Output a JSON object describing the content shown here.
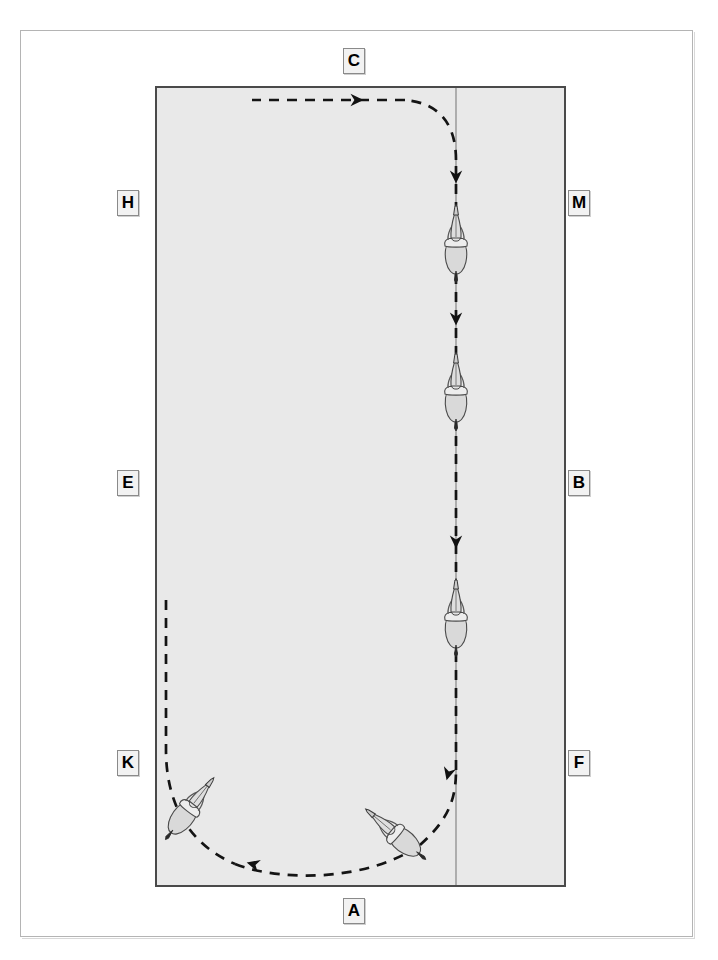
{
  "diagram": {
    "arena": {
      "fill_color": "#e9e9e9",
      "border_color": "#4a4a4a",
      "centerline_color": "#8e8e8e"
    },
    "path": {
      "style": "dashed",
      "color": "#1a1a1a",
      "dash_pattern": "10 8",
      "width": 2.6
    }
  },
  "markers": {
    "top": {
      "label": "C",
      "name": "marker-c"
    },
    "bottom": {
      "label": "A",
      "name": "marker-a"
    },
    "left_top": {
      "label": "H",
      "name": "marker-h"
    },
    "left_mid": {
      "label": "E",
      "name": "marker-e"
    },
    "left_bottom": {
      "label": "K",
      "name": "marker-k"
    },
    "right_top": {
      "label": "M",
      "name": "marker-m"
    },
    "right_mid": {
      "label": "B",
      "name": "marker-b"
    },
    "right_bottom": {
      "label": "F",
      "name": "marker-f"
    }
  },
  "horses": [
    {
      "id": "horse-1",
      "x": 456,
      "y": 243,
      "rotation": 0
    },
    {
      "id": "horse-2",
      "x": 456,
      "y": 391,
      "rotation": 0
    },
    {
      "id": "horse-3",
      "x": 456,
      "y": 617,
      "rotation": 0
    },
    {
      "id": "horse-4",
      "x": 398,
      "y": 835,
      "rotation": -52
    },
    {
      "id": "horse-5",
      "x": 185,
      "y": 811,
      "rotation": 38
    }
  ],
  "arrows": [
    {
      "id": "arrow-up-1",
      "x": 456,
      "y": 175,
      "direction": "up"
    },
    {
      "id": "arrow-up-2",
      "x": 456,
      "y": 317,
      "direction": "up"
    },
    {
      "id": "arrow-up-3",
      "x": 456,
      "y": 541,
      "direction": "up"
    },
    {
      "id": "arrow-up-4",
      "x": 447,
      "y": 771,
      "direction": "up-right"
    },
    {
      "id": "arrow-left-bottom",
      "x": 249,
      "y": 863,
      "direction": "right"
    },
    {
      "id": "arrow-left-top",
      "x": 356,
      "y": 100,
      "direction": "left"
    }
  ]
}
